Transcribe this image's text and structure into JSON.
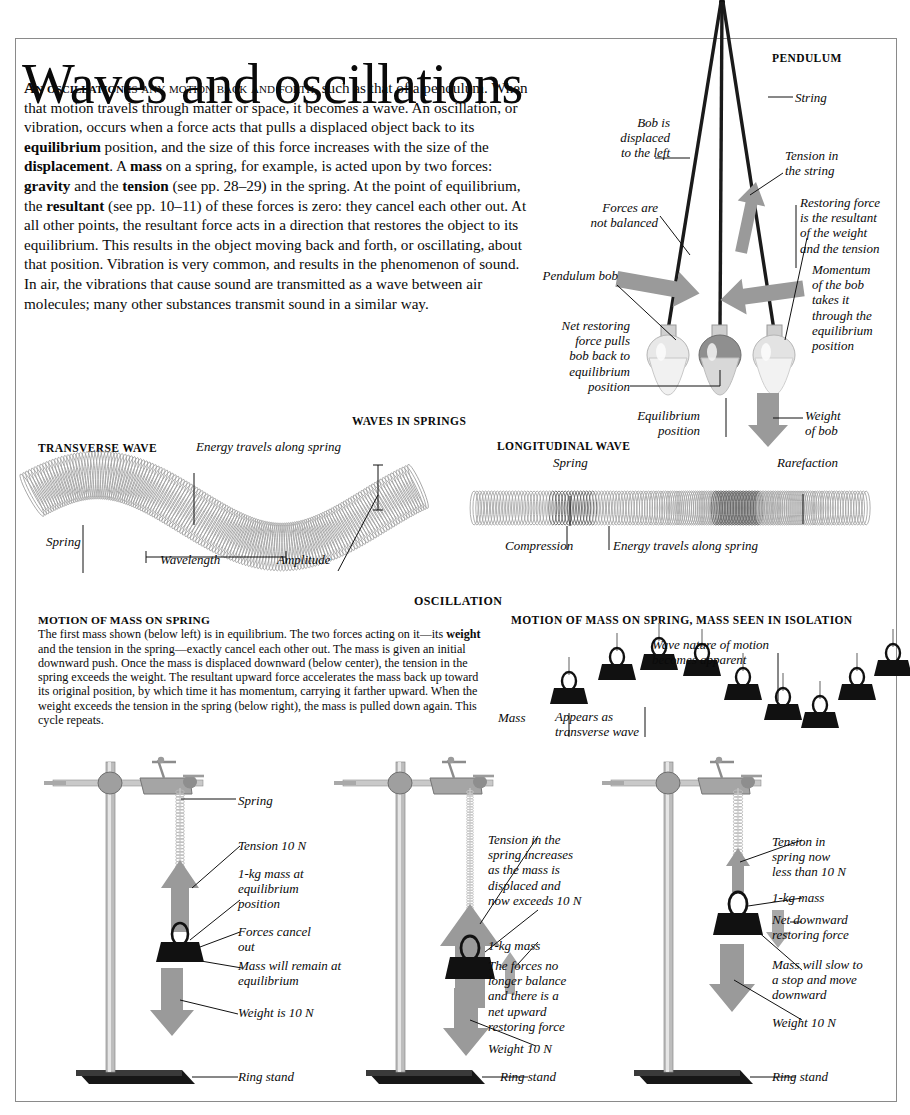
{
  "page": {
    "title": "Waves and oscillations",
    "intro_parts": {
      "lead_bold": "An oscillation",
      "lead_caps": " is any motion back and forth,",
      "rest": " such as that of a pendulum. When that motion travels through matter or space, it becomes a wave. An oscillation, or vibration, occurs when a force acts that pulls a displaced object back to its ",
      "b1": "equilibrium",
      "t2": " position, and the size of this force increases with the size of the ",
      "b2": "displacement",
      "t3": ". A ",
      "b3": "mass",
      "t4": " on a spring, for example, is acted upon by two forces: ",
      "b4": "gravity",
      "t5": " and the ",
      "b5": "tension",
      "t6": " (see pp. 28–29) in the spring. At the point of equilibrium, the ",
      "b6": "resultant",
      "t7": " (see pp. 10–11) of these forces is zero: they cancel each other out. At all other points, the resultant force acts in a direction that restores the object to its equilibrium. This results in the object moving back and forth, or oscillating, about that position. Vibration is very common, and results in the phenomenon of sound. In air, the vibrations that cause sound are transmitted as a wave between air molecules; many other substances transmit sound in a similar way."
    }
  },
  "pendulum": {
    "heading": "PENDULUM",
    "labels": {
      "string": "String",
      "bob_displaced": "Bob is\ndisplaced\nto the left",
      "tension": "Tension in\nthe string",
      "restoring": "Restoring force\nis the resultant\nof the weight\nand the tension",
      "forces_unbalanced": "Forces are\nnot balanced",
      "pendulum_bob": "Pendulum bob",
      "momentum": "Momentum\nof the bob\ntakes it\nthrough the\nequilibrium\nposition",
      "net_restoring": "Net restoring\nforce pulls\nbob back to\nequilibrium\nposition",
      "equilibrium_position": "Equilibrium\nposition",
      "weight_of_bob": "Weight\nof bob"
    }
  },
  "springs": {
    "heading": "WAVES IN SPRINGS",
    "transverse": {
      "heading": "TRANSVERSE WAVE",
      "energy": "Energy travels along spring",
      "spring": "Spring",
      "wavelength": "Wavelength",
      "amplitude": "Amplitude"
    },
    "longitudinal": {
      "heading": "LONGITUDINAL WAVE",
      "spring": "Spring",
      "rarefaction": "Rarefaction",
      "compression": "Compression",
      "energy": "Energy  travels along spring"
    }
  },
  "oscillation": {
    "heading": "OSCILLATION",
    "left_block": {
      "heading": "MOTION OF MASS ON SPRING",
      "text": "The first mass shown (below left) is in equilibrium. The two forces acting on it—its "
    },
    "left_block_parts": {
      "b_weight": "weight",
      "t2": " and the tension in the spring—exactly cancel each other out. The mass is given an initial downward push. Once the mass is displaced downward (below center), the tension in the spring exceeds the weight. The resultant upward force accelerates the mass back up toward its original position, by which time it has momentum, carrying it farther upward. When the weight exceeds the tension in the spring (below right), the mass is pulled down again. This cycle repeats."
    },
    "isolation": {
      "heading": "MOTION OF MASS ON SPRING, MASS SEEN IN ISOLATION",
      "mass": "Mass",
      "appears": "Appears as\ntransverse wave",
      "wave_nature": "Wave nature of motion\nbecomes apparent"
    }
  },
  "stands": [
    {
      "name": "left",
      "labels": {
        "spring": "Spring",
        "tension": "Tension 10 N",
        "mass": "1-kg mass at\nequilibrium\nposition",
        "forces_cancel": "Forces cancel\nout",
        "remain": "Mass will remain at\nequilibrium",
        "weight": "Weight is 10 N",
        "ring_stand": "Ring stand"
      }
    },
    {
      "name": "center",
      "labels": {
        "tension": "Tension in the\nspring increases\nas the mass is\ndisplaced and\nnow exceeds 10 N",
        "mass": "1-kg mass",
        "forces": "The forces no\nlonger balance\nand there is a\nnet upward\nrestoring force",
        "weight": "Weight 10 N",
        "ring_stand": "Ring stand"
      }
    },
    {
      "name": "right",
      "labels": {
        "tension": "Tension in\nspring now\nless than 10 N",
        "mass": "1-kg mass",
        "net_down": "Net downward\nrestoring force",
        "slow": "Mass will slow to\na stop and move\ndownward",
        "weight": "Weight 10 N",
        "ring_stand": "Ring stand"
      }
    }
  ],
  "colors": {
    "arrow_gray": "#9a9a9a",
    "ink": "#111111",
    "border": "#8a8a8a"
  }
}
